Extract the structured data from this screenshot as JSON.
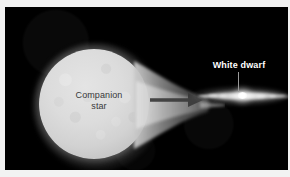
{
  "figure": {
    "kind": "astronomy-illustration",
    "background_color": "#000000",
    "frame_color": "#f2f2f2"
  },
  "labels": {
    "companion_star": {
      "line1": "Companion",
      "line2": "star",
      "color": "#38383a"
    },
    "white_dwarf": {
      "text": "White dwarf",
      "color": "#ffffff",
      "leader_line_color": "#9a9a9a"
    }
  },
  "objects": {
    "companion_star": {
      "name": "companion-star",
      "shape": "sphere",
      "surface_color": "#dcdcdc",
      "glow_color": "#c8c8c8"
    },
    "accretion_stream": {
      "name": "accretion-stream",
      "shape": "tapering-funnel",
      "color": "#9d9d9d"
    },
    "flow_arrow": {
      "name": "mass-transfer-arrow",
      "direction": "right",
      "color": "#3a3a3a"
    },
    "accretion_disk": {
      "name": "accretion-disk",
      "shape": "edge-on-ellipse",
      "color": "#d8d8d8"
    },
    "white_dwarf": {
      "name": "white-dwarf-core",
      "shape": "point-source",
      "color": "#ffffff"
    }
  }
}
